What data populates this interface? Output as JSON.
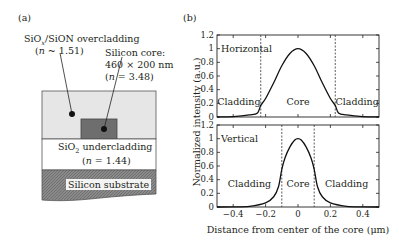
{
  "panel_a": {
    "label": "(a)",
    "overcladding": {
      "name": "SiOx/SiON overcladding",
      "name_main": "SiO",
      "name_sub": "x",
      "name_rest": "/SiON overcladding",
      "index_prefix": "(",
      "index_var": "n",
      "index_rest": " ~ 1.51)",
      "color": "#e6e6e6"
    },
    "core": {
      "name": "Silicon core:",
      "dims": "460 × 200 nm",
      "index_prefix": "(",
      "index_var": "n",
      "index_rest": " = 3.48)",
      "color": "#6e6e6e"
    },
    "undercladding": {
      "name_main": "SiO",
      "name_sub": "2",
      "name_rest": " undercladding",
      "index_prefix": "(",
      "index_var": "n",
      "index_rest": " = 1.44)",
      "color": "#ffffff"
    },
    "substrate": {
      "name": "Silicon substrate",
      "color": "#8c8c8c"
    }
  },
  "panel_b": {
    "label": "(b)",
    "ylabel": "Normalized intensity (a.u.)",
    "xlabel": "Distance from center of the core (μm)"
  },
  "chart_data": [
    {
      "type": "line",
      "title": "Horizontal",
      "xlabel": "Distance from center of the core (μm)",
      "ylabel": "Normalized intensity (a.u.)",
      "xlim": [
        -0.5,
        0.5
      ],
      "ylim": [
        0,
        1.2
      ],
      "xticks": [
        -0.4,
        -0.2,
        0,
        0.2,
        0.4
      ],
      "yticks": [
        0,
        0.2,
        0.4,
        0.6,
        0.8,
        1,
        1.2
      ],
      "ytick_labels": [
        "0",
        "0.2",
        "0.4",
        "0.6",
        "0.8",
        "1",
        "1.2"
      ],
      "boundaries": [
        -0.23,
        0.23
      ],
      "regions": [
        "Cladding",
        "Core",
        "Cladding"
      ],
      "x": [
        -0.5,
        -0.4,
        -0.3,
        -0.25,
        -0.23,
        -0.2,
        -0.15,
        -0.1,
        -0.05,
        0,
        0.05,
        0.1,
        0.15,
        0.2,
        0.23,
        0.25,
        0.3,
        0.4,
        0.5
      ],
      "values": [
        0,
        0.005,
        0.03,
        0.06,
        0.17,
        0.27,
        0.5,
        0.75,
        0.93,
        1.0,
        0.93,
        0.75,
        0.5,
        0.27,
        0.17,
        0.06,
        0.03,
        0.005,
        0
      ],
      "grid": false
    },
    {
      "type": "line",
      "title": "Vertical",
      "xlabel": "Distance from center of the core (μm)",
      "ylabel": "Normalized intensity (a.u.)",
      "xlim": [
        -0.5,
        0.5
      ],
      "ylim": [
        0,
        1.2
      ],
      "xticks": [
        -0.4,
        -0.2,
        0,
        0.2,
        0.4
      ],
      "xtick_labels": [
        "−0.4",
        "−0.2",
        "0",
        "0.2",
        "0.4"
      ],
      "yticks": [
        0,
        0.2,
        0.4,
        0.6,
        0.8,
        1,
        1.2
      ],
      "ytick_labels": [
        "0",
        "0.2",
        "0.4",
        "0.6",
        "0.8",
        "1",
        "1.2"
      ],
      "boundaries": [
        -0.1,
        0.1
      ],
      "regions": [
        "Cladding",
        "Core",
        "Cladding"
      ],
      "x": [
        -0.5,
        -0.4,
        -0.3,
        -0.2,
        -0.15,
        -0.12,
        -0.1,
        -0.08,
        -0.05,
        -0.02,
        0,
        0.02,
        0.05,
        0.08,
        0.1,
        0.12,
        0.15,
        0.2,
        0.3,
        0.4,
        0.5
      ],
      "values": [
        0,
        0.002,
        0.01,
        0.06,
        0.15,
        0.3,
        0.55,
        0.72,
        0.88,
        0.98,
        1.0,
        0.98,
        0.88,
        0.72,
        0.55,
        0.3,
        0.15,
        0.06,
        0.01,
        0.002,
        0
      ],
      "grid": false
    }
  ]
}
